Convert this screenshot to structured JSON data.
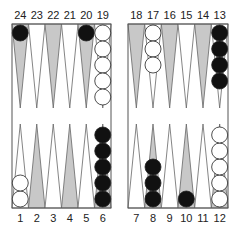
{
  "board": {
    "colors": {
      "light_point": "#ffffff",
      "dark_point": "#c8c8c8",
      "frame": "#555555",
      "black_checker": "#111111",
      "white_checker": "#ffffff"
    },
    "top_labels": [
      "24",
      "23",
      "22",
      "21",
      "20",
      "19",
      "18",
      "17",
      "16",
      "15",
      "14",
      "13"
    ],
    "bottom_labels": [
      "1",
      "2",
      "3",
      "4",
      "5",
      "6",
      "7",
      "8",
      "9",
      "10",
      "11",
      "12"
    ],
    "points": [
      {
        "point": 24,
        "color": "black",
        "count": 1
      },
      {
        "point": 20,
        "color": "black",
        "count": 1
      },
      {
        "point": 19,
        "color": "white",
        "count": 5
      },
      {
        "point": 17,
        "color": "white",
        "count": 3
      },
      {
        "point": 13,
        "color": "black",
        "count": 4
      },
      {
        "point": 1,
        "color": "white",
        "count": 2
      },
      {
        "point": 6,
        "color": "black",
        "count": 5
      },
      {
        "point": 8,
        "color": "black",
        "count": 3
      },
      {
        "point": 10,
        "color": "black",
        "count": 1
      },
      {
        "point": 12,
        "color": "white",
        "count": 5
      }
    ]
  }
}
